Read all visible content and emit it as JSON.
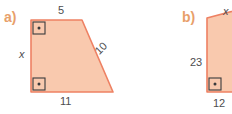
{
  "figure": {
    "background_color": "#FFFFFF",
    "shape_fill_color": "#F9C9AE",
    "shape_stroke_color": "#EE8163",
    "part_label_color": "#E8A06A",
    "dimension_label_color": "#4D4D4F",
    "right_angle_marker_color": "#3A3A3C",
    "parts": [
      {
        "id": "a",
        "part_label": "a)",
        "shape_type": "right trapezoid",
        "right_angle_markers": 2,
        "labels": [
          {
            "name": "top-side-length",
            "text": "5",
            "style": "plain"
          },
          {
            "name": "left-side-length",
            "text": "x",
            "style": "italic"
          },
          {
            "name": "slant-side-length",
            "text": "10",
            "style": "plain"
          },
          {
            "name": "bottom-side-length",
            "text": "11",
            "style": "plain"
          }
        ]
      },
      {
        "id": "b",
        "part_label": "b)",
        "shape_type": "right triangle",
        "right_angle_markers": 1,
        "labels": [
          {
            "name": "hypotenuse-length",
            "text": "x",
            "style": "italic"
          },
          {
            "name": "left-side-length",
            "text": "23",
            "style": "plain"
          },
          {
            "name": "bottom-side-length",
            "text": "12",
            "style": "plain"
          }
        ]
      }
    ]
  }
}
